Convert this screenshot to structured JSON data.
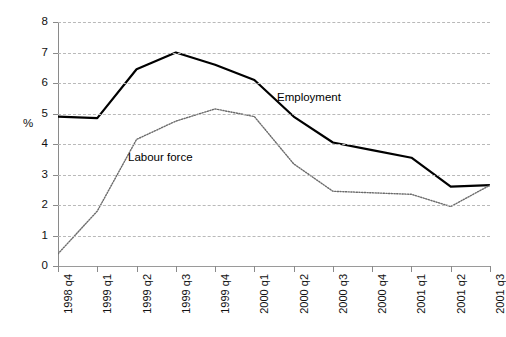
{
  "chart_data": {
    "type": "line",
    "title": "",
    "xlabel": "",
    "ylabel": "%",
    "ylim": [
      0,
      8
    ],
    "yticks": [
      "0",
      "1",
      "2",
      "3",
      "4",
      "5",
      "6",
      "7",
      "8"
    ],
    "grid": true,
    "legend_position": "inline-annotations",
    "categories": [
      "1998 q4",
      "1999 q1",
      "1999 q2",
      "1999 q3",
      "1999 q4",
      "2000 q1",
      "2000 q2",
      "2000 q3",
      "2000 q4",
      "2001 q1",
      "2001 q2",
      "2001 q3"
    ],
    "series": [
      {
        "name": "Employment",
        "style": "solid",
        "color": "#000000",
        "values": [
          4.9,
          4.85,
          6.45,
          7.0,
          6.6,
          6.1,
          4.9,
          4.05,
          3.8,
          3.55,
          2.6,
          2.65
        ]
      },
      {
        "name": "Labour force",
        "style": "dotted",
        "color": "#6b6b6b",
        "values": [
          0.4,
          1.8,
          4.15,
          4.75,
          5.15,
          4.9,
          3.35,
          2.45,
          2.4,
          2.35,
          1.95,
          2.65
        ]
      }
    ],
    "annotations": [
      {
        "text": "Employment",
        "series": "Employment"
      },
      {
        "text": "Labour force",
        "series": "Labour force"
      }
    ]
  },
  "axis": {
    "y_title": "%"
  }
}
